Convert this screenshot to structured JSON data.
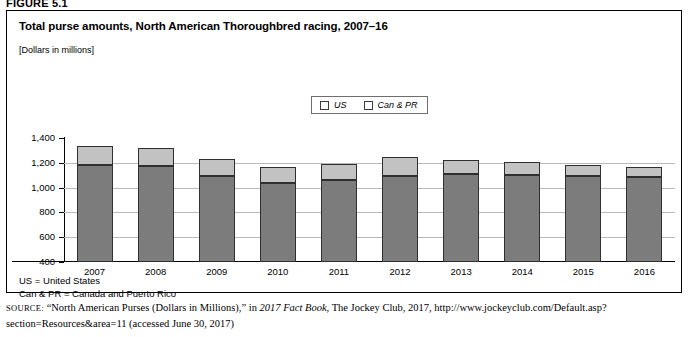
{
  "figure": {
    "label": "FIGURE 5.1"
  },
  "header": {
    "title": "Total purse amounts, North American Thoroughbred racing, 2007–16",
    "subtitle": "[Dollars in millions]"
  },
  "footnotes": [
    "US = United States",
    "Can & PR = Canada and Puerto Rico"
  ],
  "source": {
    "label": "SOURCE:",
    "text_1": " “North American Purses (Dollars in Millions),” in ",
    "italic_1": "2017 Fact Book",
    "text_2": ", The Jockey Club, 2017, http://www.jockeyclub.com/Default.asp?section=Resources&area=11 (accessed June 30, 2017)"
  },
  "colors": {
    "us": "#7c7c7c",
    "can_pr": "#c2c2c2",
    "bar_outline": "#2f2f2f",
    "gridline": "#b9b9b9"
  },
  "chart_data": {
    "type": "bar",
    "stacked": true,
    "title": "Total purse amounts, North American Thoroughbred racing, 2007–16",
    "subtitle": "[Dollars in millions]",
    "xlabel": "",
    "ylabel": "",
    "ylim": [
      400,
      1400
    ],
    "yticks": [
      400,
      600,
      800,
      1000,
      1200,
      1400
    ],
    "ytick_labels": [
      "400",
      "600",
      "800",
      "1,000",
      "1,200",
      "1,400"
    ],
    "grid": true,
    "legend_position": "top-center",
    "categories": [
      "2007",
      "2008",
      "2009",
      "2010",
      "2011",
      "2012",
      "2013",
      "2014",
      "2015",
      "2016"
    ],
    "series": [
      {
        "name": "US",
        "color": "#7c7c7c",
        "values": [
          1183,
          1178,
          1090,
          1035,
          1065,
          1095,
          1110,
          1100,
          1090,
          1085
        ]
      },
      {
        "name": "Can & PR",
        "color": "#c2c2c2",
        "values": [
          152,
          145,
          142,
          130,
          123,
          155,
          115,
          108,
          95,
          80
        ]
      }
    ],
    "totals": [
      1335,
      1323,
      1232,
      1165,
      1188,
      1250,
      1225,
      1208,
      1185,
      1165
    ]
  }
}
